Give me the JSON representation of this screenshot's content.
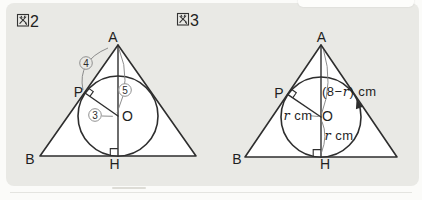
{
  "colors": {
    "panel_bg": "#e9e9e5",
    "line": "#2e2e2e",
    "leader_gray": "#808080",
    "text": "#1f1f1f",
    "triangle_fill": "#ffffff"
  },
  "figure2": {
    "label": "図2",
    "number": "2",
    "vertices": {
      "A": "A",
      "P": "P",
      "O": "O",
      "B": "B",
      "H": "H"
    },
    "circled_numbers": {
      "segment_AP": "4",
      "segment_AO": "5",
      "segment_OP": "3"
    }
  },
  "figure3": {
    "label": "図3",
    "number": "3",
    "vertices": {
      "A": "A",
      "P": "P",
      "O": "O",
      "B": "B",
      "H": "H"
    },
    "measurements": {
      "segment_AO": {
        "text": "(8−r) cm",
        "parts": [
          "(8−",
          "r",
          ") cm"
        ]
      },
      "segment_OP": {
        "text": "r cm",
        "parts": [
          "r",
          " cm"
        ]
      },
      "segment_OH": {
        "text": "r cm",
        "parts": [
          "r",
          " cm"
        ]
      }
    }
  }
}
